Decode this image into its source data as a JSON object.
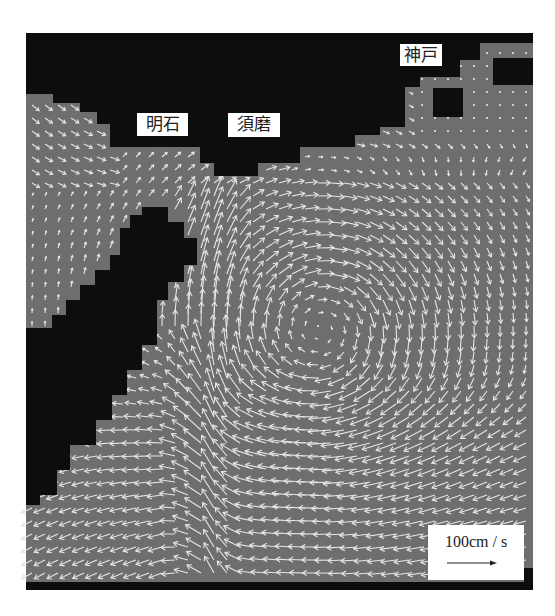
{
  "figure": {
    "type": "tidal-current-vector-map",
    "background_color": "#ffffff",
    "sea_color": "#6e6e6e",
    "land_color": "#0d0d0d",
    "arrow_color": "#e6e6e6",
    "map_bounds": {
      "left": 26,
      "top": 33,
      "right": 533,
      "bottom": 590
    }
  },
  "place_labels": [
    {
      "id": "akashi",
      "text": "明石",
      "x": 137,
      "y": 113,
      "w": 51,
      "h": 23
    },
    {
      "id": "suma",
      "text": "須磨",
      "x": 228,
      "y": 113,
      "w": 52,
      "h": 24
    },
    {
      "id": "kobe",
      "text": "神戸",
      "x": 400,
      "y": 44,
      "w": 42,
      "h": 22
    }
  ],
  "legend": {
    "scale_text": "100cm / s",
    "arrow_length_px": 48,
    "arrow_icon": "right-arrow-icon"
  },
  "land_polygons": {
    "north_coast": [
      [
        26,
        33
      ],
      [
        533,
        33
      ],
      [
        533,
        43
      ],
      [
        480,
        43
      ],
      [
        480,
        60
      ],
      [
        460,
        60
      ],
      [
        460,
        77
      ],
      [
        420,
        77
      ],
      [
        420,
        87
      ],
      [
        405,
        87
      ],
      [
        405,
        127
      ],
      [
        380,
        127
      ],
      [
        380,
        135
      ],
      [
        355,
        135
      ],
      [
        355,
        147
      ],
      [
        300,
        147
      ],
      [
        300,
        163
      ],
      [
        258,
        163
      ],
      [
        258,
        176
      ],
      [
        214,
        176
      ],
      [
        214,
        163
      ],
      [
        200,
        163
      ],
      [
        200,
        147
      ],
      [
        110,
        147
      ],
      [
        110,
        124
      ],
      [
        97,
        124
      ],
      [
        97,
        112
      ],
      [
        80,
        112
      ],
      [
        80,
        103
      ],
      [
        53,
        103
      ],
      [
        53,
        94
      ],
      [
        26,
        94
      ]
    ],
    "kobe_island_1": [
      [
        433,
        88
      ],
      [
        463,
        88
      ],
      [
        463,
        117
      ],
      [
        433,
        117
      ]
    ],
    "kobe_island_2": [
      [
        493,
        58
      ],
      [
        533,
        58
      ],
      [
        533,
        85
      ],
      [
        493,
        85
      ]
    ],
    "awaji": [
      [
        142,
        207
      ],
      [
        168,
        207
      ],
      [
        168,
        222
      ],
      [
        184,
        222
      ],
      [
        184,
        238
      ],
      [
        197,
        238
      ],
      [
        197,
        265
      ],
      [
        184,
        265
      ],
      [
        184,
        282
      ],
      [
        168,
        282
      ],
      [
        168,
        300
      ],
      [
        157,
        300
      ],
      [
        157,
        345
      ],
      [
        142,
        345
      ],
      [
        142,
        370
      ],
      [
        127,
        370
      ],
      [
        127,
        395
      ],
      [
        112,
        395
      ],
      [
        112,
        420
      ],
      [
        96,
        420
      ],
      [
        96,
        445
      ],
      [
        70,
        445
      ],
      [
        70,
        470
      ],
      [
        57,
        470
      ],
      [
        57,
        495
      ],
      [
        40,
        495
      ],
      [
        40,
        505
      ],
      [
        26,
        505
      ],
      [
        26,
        328
      ],
      [
        52,
        328
      ],
      [
        52,
        315
      ],
      [
        66,
        315
      ],
      [
        66,
        300
      ],
      [
        80,
        300
      ],
      [
        80,
        285
      ],
      [
        95,
        285
      ],
      [
        95,
        270
      ],
      [
        110,
        270
      ],
      [
        110,
        255
      ],
      [
        120,
        255
      ],
      [
        120,
        228
      ],
      [
        130,
        228
      ],
      [
        130,
        215
      ],
      [
        142,
        215
      ]
    ],
    "bottom_band": [
      [
        26,
        582
      ],
      [
        533,
        582
      ],
      [
        533,
        590
      ],
      [
        26,
        590
      ]
    ],
    "bottom_right_band": [
      [
        524,
        568
      ],
      [
        533,
        568
      ],
      [
        533,
        582
      ],
      [
        524,
        582
      ]
    ]
  },
  "vector_field": {
    "grid_spacing": 13,
    "origin": [
      32,
      40
    ],
    "vortex": {
      "cx": 320,
      "cy": 330,
      "strength": 1.0,
      "radius": 150
    },
    "jet": {
      "x": 210,
      "width": 55,
      "direction": "north"
    },
    "westward_flow_rows": {
      "y_from": 360,
      "y_to": 580
    },
    "northwest_inflow": {
      "region": [
        26,
        94,
        110,
        180
      ],
      "direction": "southeast"
    }
  }
}
